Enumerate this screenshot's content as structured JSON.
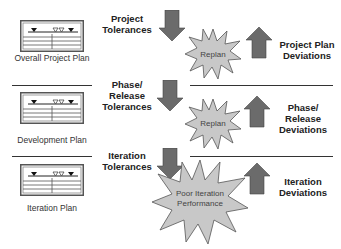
{
  "diagram": {
    "levels": [
      {
        "plan_label": "Overall Project Plan",
        "tolerance_label_line1": "Project",
        "tolerance_label_line2": "Tolerances",
        "tolerance_label_line3": "",
        "burst_label_line1": "Replan",
        "burst_label_line2": "",
        "deviation_label_line1": "Project Plan",
        "deviation_label_line2": "Deviations",
        "deviation_label_line3": ""
      },
      {
        "plan_label": "Development Plan",
        "tolerance_label_line1": "Phase/",
        "tolerance_label_line2": "Release",
        "tolerance_label_line3": "Tolerances",
        "burst_label_line1": "Replan",
        "burst_label_line2": "",
        "deviation_label_line1": "Phase/",
        "deviation_label_line2": "Release",
        "deviation_label_line3": "Deviations"
      },
      {
        "plan_label": "Iteration Plan",
        "tolerance_label_line1": "Iteration",
        "tolerance_label_line2": "Tolerances",
        "tolerance_label_line3": "",
        "burst_label_line1": "Poor Iteration",
        "burst_label_line2": "Performance",
        "deviation_label_line1": "Iteration",
        "deviation_label_line2": "Deviations",
        "deviation_label_line3": ""
      }
    ],
    "icons": {
      "plan": "gantt-plan-icon",
      "down_arrow": "arrow-down-icon",
      "up_arrow": "arrow-up-icon",
      "burst": "starburst-icon"
    },
    "colors": {
      "arrow_fill": "#6b6b6b",
      "burst_fill": "#c8c8c8",
      "burst_stroke": "#555555",
      "line": "#333333"
    }
  }
}
